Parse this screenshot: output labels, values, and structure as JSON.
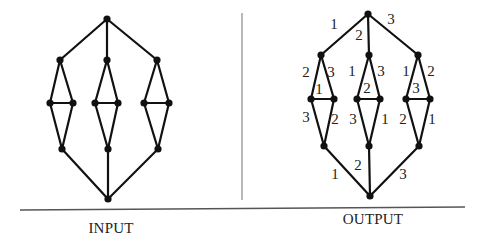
{
  "captions": {
    "input": "INPUT",
    "output": "OUTPUT"
  },
  "graphs": {
    "input": {
      "nodes": {
        "top": [
          107,
          19
        ],
        "u1": [
          60,
          60
        ],
        "u2": [
          107,
          60
        ],
        "u3": [
          157,
          60
        ],
        "m1a": [
          50,
          103
        ],
        "m1b": [
          73,
          103
        ],
        "m2a": [
          95,
          103
        ],
        "m2b": [
          118,
          103
        ],
        "m3a": [
          144,
          103
        ],
        "m3b": [
          169,
          103
        ],
        "l1": [
          62,
          149
        ],
        "l2": [
          108,
          149
        ],
        "l3": [
          158,
          149
        ],
        "bot": [
          108,
          199
        ]
      },
      "edges": [
        [
          "top",
          "u1"
        ],
        [
          "top",
          "u2"
        ],
        [
          "top",
          "u3"
        ],
        [
          "u1",
          "m1a"
        ],
        [
          "u1",
          "m1b"
        ],
        [
          "m1a",
          "m1b"
        ],
        [
          "m1a",
          "l1"
        ],
        [
          "m1b",
          "l1"
        ],
        [
          "u2",
          "m2a"
        ],
        [
          "u2",
          "m2b"
        ],
        [
          "m2a",
          "m2b"
        ],
        [
          "m2a",
          "l2"
        ],
        [
          "m2b",
          "l2"
        ],
        [
          "u3",
          "m3a"
        ],
        [
          "u3",
          "m3b"
        ],
        [
          "m3a",
          "m3b"
        ],
        [
          "m3a",
          "l3"
        ],
        [
          "m3b",
          "l3"
        ],
        [
          "l1",
          "bot"
        ],
        [
          "l2",
          "bot"
        ],
        [
          "l3",
          "bot"
        ]
      ]
    },
    "output": {
      "nodes": {
        "top": [
          368,
          14
        ],
        "u1": [
          321,
          55
        ],
        "u2": [
          369,
          55
        ],
        "u3": [
          418,
          55
        ],
        "m1a": [
          311,
          99
        ],
        "m1b": [
          334,
          99
        ],
        "m2a": [
          357,
          99
        ],
        "m2b": [
          380,
          99
        ],
        "m3a": [
          406,
          99
        ],
        "m3b": [
          430,
          99
        ],
        "l1": [
          324,
          146
        ],
        "l2": [
          369,
          146
        ],
        "l3": [
          419,
          146
        ],
        "bot": [
          370,
          196
        ]
      },
      "edges": [
        [
          "top",
          "u1"
        ],
        [
          "top",
          "u2"
        ],
        [
          "top",
          "u3"
        ],
        [
          "u1",
          "m1a"
        ],
        [
          "u1",
          "m1b"
        ],
        [
          "m1a",
          "m1b"
        ],
        [
          "m1a",
          "l1"
        ],
        [
          "m1b",
          "l1"
        ],
        [
          "u2",
          "m2a"
        ],
        [
          "u2",
          "m2b"
        ],
        [
          "m2a",
          "m2b"
        ],
        [
          "m2a",
          "l2"
        ],
        [
          "m2b",
          "l2"
        ],
        [
          "u3",
          "m3a"
        ],
        [
          "u3",
          "m3b"
        ],
        [
          "m3a",
          "m3b"
        ],
        [
          "m3a",
          "l3"
        ],
        [
          "m3b",
          "l3"
        ],
        [
          "l1",
          "bot"
        ],
        [
          "l2",
          "bot"
        ],
        [
          "l3",
          "bot"
        ]
      ],
      "edge_labels": [
        {
          "text": "1",
          "x": 334,
          "y": 29
        },
        {
          "text": "2",
          "x": 359,
          "y": 40
        },
        {
          "text": "3",
          "x": 391,
          "y": 24
        },
        {
          "text": "2",
          "x": 306,
          "y": 77
        },
        {
          "text": "3",
          "x": 331,
          "y": 77
        },
        {
          "text": "1",
          "x": 319,
          "y": 94
        },
        {
          "text": "1",
          "x": 352,
          "y": 76
        },
        {
          "text": "3",
          "x": 381,
          "y": 76
        },
        {
          "text": "2",
          "x": 367,
          "y": 93
        },
        {
          "text": "1",
          "x": 406,
          "y": 76
        },
        {
          "text": "2",
          "x": 431,
          "y": 76
        },
        {
          "text": "3",
          "x": 416,
          "y": 93
        },
        {
          "text": "3",
          "x": 306,
          "y": 122
        },
        {
          "text": "2",
          "x": 335,
          "y": 124
        },
        {
          "text": "3",
          "x": 353,
          "y": 124
        },
        {
          "text": "1",
          "x": 385,
          "y": 124
        },
        {
          "text": "2",
          "x": 403,
          "y": 124
        },
        {
          "text": "1",
          "x": 432,
          "y": 124
        },
        {
          "text": "1",
          "x": 335,
          "y": 179
        },
        {
          "text": "2",
          "x": 358,
          "y": 170
        },
        {
          "text": "3",
          "x": 403,
          "y": 179
        }
      ]
    }
  },
  "layout": {
    "divider": {
      "x": 242,
      "y1": 13,
      "y2": 200
    },
    "baseline": {
      "y1": 210,
      "y2": 207,
      "x1": 20,
      "x2": 465
    },
    "input_caption_pos": [
      111,
      233
    ],
    "output_caption_pos": [
      373,
      224
    ]
  }
}
